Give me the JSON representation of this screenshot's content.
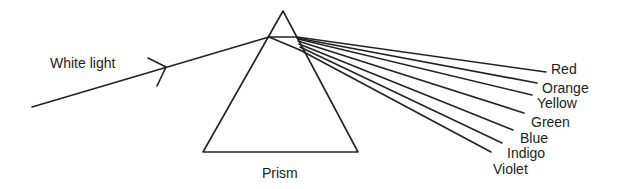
{
  "diagram": {
    "incident_label": "White light",
    "prism_label": "Prism",
    "spectrum": [
      {
        "name": "Red"
      },
      {
        "name": "Orange"
      },
      {
        "name": "Yellow"
      },
      {
        "name": "Green"
      },
      {
        "name": "Blue"
      },
      {
        "name": "Indigo"
      },
      {
        "name": "Violet"
      }
    ],
    "colors": {
      "stroke": "#222222",
      "background": "#ffffff"
    }
  }
}
